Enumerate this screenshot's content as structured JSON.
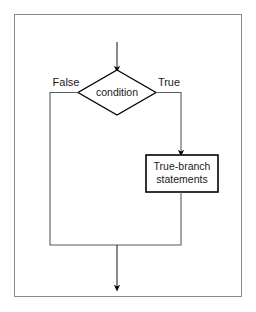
{
  "figure": {
    "name": "conditional-flowchart",
    "kind": "flowchart",
    "background_color": "#ffffff",
    "frame": {
      "name": "figure-border",
      "stroke_color": "#808080",
      "x": 14,
      "y": 14,
      "width": 228,
      "height": 283
    }
  },
  "nodes": {
    "entry_arrow": {
      "name": "entry-arrow",
      "label": ""
    },
    "decision": {
      "name": "condition-decision",
      "label": "condition",
      "shape": "diamond",
      "stroke_color": "#000000",
      "fill_color": "#ffffff"
    },
    "process": {
      "name": "true-branch-process",
      "line1": "True-branch",
      "line2": "statements",
      "shape": "rectangle",
      "stroke_color": "#000000",
      "fill_color": "#ffffff"
    },
    "exit_arrow": {
      "name": "exit-arrow",
      "label": ""
    }
  },
  "edges": {
    "false_label": "False",
    "true_label": "True",
    "edge_color": "#3a3a3a",
    "arrow_color": "#000000"
  }
}
